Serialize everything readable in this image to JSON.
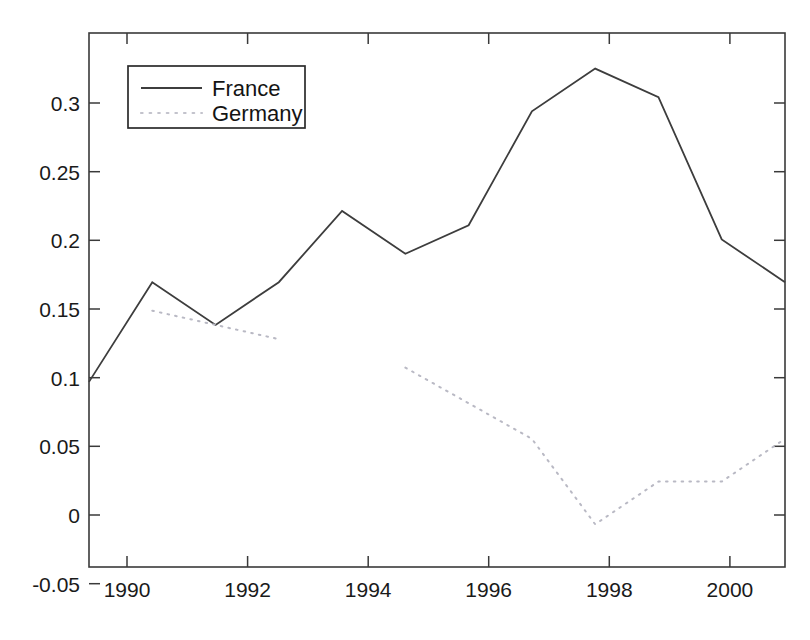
{
  "chart_data": {
    "type": "line",
    "title": "",
    "xlabel": "",
    "ylabel": "",
    "x": [
      1990,
      1991,
      1992,
      1993,
      1994,
      1995,
      1996,
      1997,
      1998,
      1999,
      2000,
      2001
    ],
    "xlim": [
      1990,
      2001
    ],
    "ylim": [
      -0.05,
      0.325
    ],
    "grid": false,
    "legend_position": "upper left",
    "xtick_labels": [
      "1990",
      "1992",
      "1994",
      "1996",
      "1998",
      "2000"
    ],
    "xtick_values": [
      1990,
      1992,
      1994,
      1996,
      1998,
      2000
    ],
    "xtick_minor_values": [
      1991,
      1993,
      1995,
      1997,
      1999,
      2001
    ],
    "ytick_labels": [
      "-0.05",
      "0",
      "0.05",
      "0.1",
      "0.15",
      "0.2",
      "0.25",
      "0.3"
    ],
    "ytick_values": [
      -0.05,
      0,
      0.05,
      0.1,
      0.15,
      0.2,
      0.25,
      0.3
    ],
    "series": [
      {
        "name": "France",
        "style": "solid",
        "color": "#3d3d3d",
        "x": [
          1990,
          1991,
          1992,
          1993,
          1994,
          1995,
          1996,
          1997,
          1998,
          1999,
          2000,
          2001
        ],
        "values": [
          0.08,
          0.15,
          0.12,
          0.15,
          0.2,
          0.17,
          0.19,
          0.27,
          0.3,
          0.28,
          0.18,
          0.15
        ]
      },
      {
        "name": "Germany",
        "style": "dotted",
        "color": "#b9b9c4",
        "segments": [
          {
            "x": [
              1991,
              1992,
              1993
            ],
            "values": [
              0.13,
              0.12,
              0.11
            ]
          },
          {
            "x": [
              1995,
              1996,
              1997,
              1998,
              1999,
              2000,
              2001
            ],
            "values": [
              0.09,
              0.065,
              0.04,
              -0.02,
              0.01,
              0.01,
              0.04
            ]
          }
        ]
      }
    ]
  },
  "legend": {
    "entries": [
      {
        "label": "France"
      },
      {
        "label": "Germany"
      }
    ]
  },
  "axes": {
    "y_labels": [
      "0.3",
      "0.25",
      "0.2",
      "0.15",
      "0.1",
      "0.05",
      "0",
      "-0.05"
    ],
    "x_labels": [
      "1990",
      "1992",
      "1994",
      "1996",
      "1998",
      "2000"
    ]
  }
}
